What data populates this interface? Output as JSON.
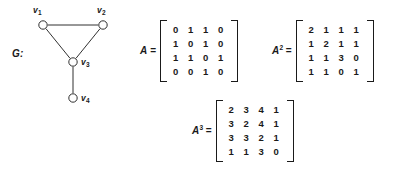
{
  "figure": {
    "graph": {
      "label": "G:",
      "vertices": [
        {
          "id": "v1",
          "name": "v",
          "sub": "1",
          "cx": 43,
          "cy": 25,
          "label_x": 33,
          "label_y": 6
        },
        {
          "id": "v2",
          "name": "v",
          "sub": "2",
          "cx": 103,
          "cy": 25,
          "label_x": 97,
          "label_y": 6
        },
        {
          "id": "v3",
          "name": "v",
          "sub": "3",
          "cx": 73,
          "cy": 62,
          "label_x": 81,
          "label_y": 58
        },
        {
          "id": "v4",
          "name": "v",
          "sub": "4",
          "cx": 73,
          "cy": 98,
          "label_x": 81,
          "label_y": 94
        }
      ],
      "edges": [
        {
          "from": "v1",
          "to": "v2"
        },
        {
          "from": "v1",
          "to": "v3"
        },
        {
          "from": "v2",
          "to": "v3"
        },
        {
          "from": "v3",
          "to": "v4"
        }
      ],
      "vertex_radius": 4.2,
      "stroke_color": "#1a1a1a"
    },
    "matrices": [
      {
        "id": "A",
        "name": "A",
        "exponent": "",
        "equals": "=",
        "left": 140,
        "top": 20,
        "rows": [
          [
            0,
            1,
            1,
            0
          ],
          [
            1,
            0,
            1,
            0
          ],
          [
            1,
            1,
            0,
            1
          ],
          [
            0,
            0,
            1,
            0
          ]
        ]
      },
      {
        "id": "A2",
        "name": "A",
        "exponent": "2",
        "equals": "=",
        "left": 272,
        "top": 20,
        "rows": [
          [
            2,
            1,
            1,
            1
          ],
          [
            1,
            2,
            1,
            1
          ],
          [
            1,
            1,
            3,
            0
          ],
          [
            1,
            1,
            0,
            1
          ]
        ]
      },
      {
        "id": "A3",
        "name": "A",
        "exponent": "3",
        "equals": "=",
        "left": 192,
        "top": 100,
        "rows": [
          [
            2,
            3,
            4,
            1
          ],
          [
            3,
            2,
            4,
            1
          ],
          [
            3,
            3,
            2,
            1
          ],
          [
            1,
            1,
            3,
            0
          ]
        ]
      }
    ]
  }
}
